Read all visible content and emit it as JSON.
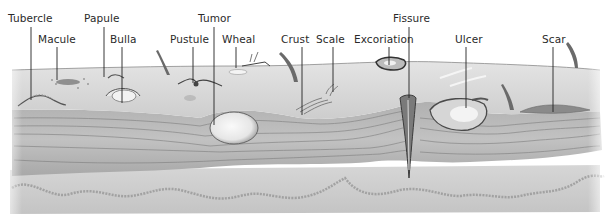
{
  "figure": {
    "labels": [
      {
        "id": "tubercle",
        "text": "Tubercle",
        "x": 8,
        "y": 12,
        "line_x": 31,
        "line_y1": 27,
        "line_y2": 100
      },
      {
        "id": "macule",
        "text": "Macule",
        "x": 38,
        "y": 33,
        "line_x": 57,
        "line_y1": 47,
        "line_y2": 80
      },
      {
        "id": "papule",
        "text": "Papule",
        "x": 84,
        "y": 12,
        "line_x": 104,
        "line_y1": 27,
        "line_y2": 77
      },
      {
        "id": "bulla",
        "text": "Bulla",
        "x": 110,
        "y": 33,
        "line_x": 122,
        "line_y1": 47,
        "line_y2": 103
      },
      {
        "id": "pustule",
        "text": "Pustule",
        "x": 170,
        "y": 33,
        "line_x": 193,
        "line_y1": 47,
        "line_y2": 83
      },
      {
        "id": "tumor",
        "text": "Tumor",
        "x": 198,
        "y": 12,
        "line_x": 214,
        "line_y1": 27,
        "line_y2": 125
      },
      {
        "id": "wheal",
        "text": "Wheal",
        "x": 222,
        "y": 33,
        "line_x": 236,
        "line_y1": 47,
        "line_y2": 68
      },
      {
        "id": "crust",
        "text": "Crust",
        "x": 281,
        "y": 33,
        "line_x": 302,
        "line_y1": 47,
        "line_y2": 115
      },
      {
        "id": "scale",
        "text": "Scale",
        "x": 316,
        "y": 33,
        "line_x": 333,
        "line_y1": 47,
        "line_y2": 92
      },
      {
        "id": "excoriation",
        "text": "Excoriation",
        "x": 354,
        "y": 33,
        "line_x": 389,
        "line_y1": 47,
        "line_y2": 65
      },
      {
        "id": "fissure",
        "text": "Fissure",
        "x": 393,
        "y": 12,
        "line_x": 409,
        "line_y1": 27,
        "line_y2": 98
      },
      {
        "id": "ulcer",
        "text": "Ulcer",
        "x": 455,
        "y": 33,
        "line_x": 466,
        "line_y1": 47,
        "line_y2": 108
      },
      {
        "id": "scar",
        "text": "Scar",
        "x": 542,
        "y": 33,
        "line_x": 553,
        "line_y1": 47,
        "line_y2": 112
      }
    ],
    "colors": {
      "background": "#ffffff",
      "epidermis": "#d8d8d8",
      "dermis": "#bdbdbd",
      "dermis_lines": "#8a8a8a",
      "subcutis": "#cfcfcf",
      "ink": "#2a2a2a",
      "lesion_dark": "#555555",
      "lesion_light": "#f2f2f2"
    }
  }
}
